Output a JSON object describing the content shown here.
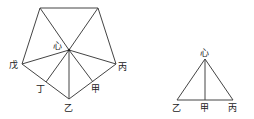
{
  "pentagon": {
    "labels": {
      "center": "心",
      "left": "戊",
      "right": "丙",
      "bottom": "乙",
      "lower_left_mid": "丁",
      "lower_right_mid": "甲"
    }
  },
  "triangle": {
    "labels": {
      "apex": "心",
      "left": "乙",
      "mid": "甲",
      "right": "丙"
    }
  },
  "colors": {
    "line": "#444444",
    "text": "#222222"
  }
}
